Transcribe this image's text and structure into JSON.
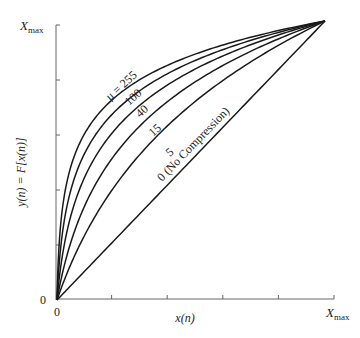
{
  "chart_data": {
    "type": "line",
    "title": "",
    "xlabel": "x(n)",
    "ylabel": "y(n) = F[x(n)]",
    "x_ticks": [
      "0",
      "X_max"
    ],
    "y_ticks": [
      "0",
      "X_max"
    ],
    "x_tick_count": 5,
    "y_tick_count": 5,
    "xlim": [
      0,
      1
    ],
    "ylim": [
      0,
      1
    ],
    "grid": false,
    "legend": "inline curve labels",
    "formula": "y = ln(1 + mu*x) / ln(1 + mu)",
    "series": [
      {
        "name": "μ = 255",
        "mu": 255,
        "label": "μ = 255"
      },
      {
        "name": "100",
        "mu": 100,
        "label": "100"
      },
      {
        "name": "40",
        "mu": 40,
        "label": "40"
      },
      {
        "name": "15",
        "mu": 15,
        "label": "15"
      },
      {
        "name": "5",
        "mu": 5,
        "label": "5"
      },
      {
        "name": "0 (No Compression)",
        "mu": 0,
        "label": "0 (No Compression)"
      }
    ]
  },
  "labels": {
    "y_max": "X",
    "y_max_sub": "max",
    "x_max": "X",
    "x_max_sub": "max",
    "y_origin": "0",
    "x_origin": "0",
    "xlabel": "x(n)",
    "ylabel": "y(n) = F[x(n)]"
  }
}
